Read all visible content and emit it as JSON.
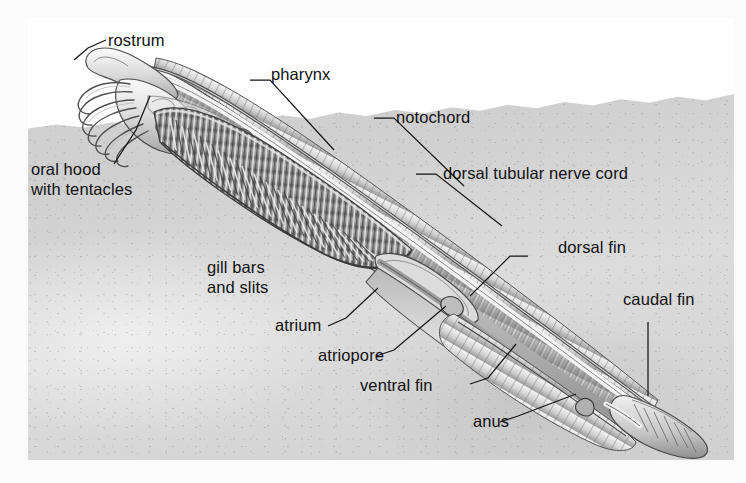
{
  "figure": {
    "view": "lateral cutaway, animal buried tail-down in sediment",
    "palette": {
      "background": "#fdfdfd",
      "water": "#ffffff",
      "sediment_light": "#dcdcdc",
      "sediment_mid": "#d0d0d0",
      "body_light": "#f2f2f2",
      "body_mid": "#b9b9b9",
      "body_dark": "#6e6e6e",
      "outline": "#4a4a4a",
      "label_text": "#111111",
      "leader_line": "#151515"
    }
  },
  "labels": [
    {
      "id": "rostrum",
      "text": "rostrum"
    },
    {
      "id": "pharynx",
      "text": "pharynx"
    },
    {
      "id": "notochord",
      "text": "notochord"
    },
    {
      "id": "dorsal-nerve-cord",
      "text": "dorsal tubular nerve cord"
    },
    {
      "id": "oral-hood-line1",
      "text": "oral hood"
    },
    {
      "id": "oral-hood-line2",
      "text": "with tentacles"
    },
    {
      "id": "dorsal-fin",
      "text": "dorsal fin"
    },
    {
      "id": "caudal-fin",
      "text": "caudal fin"
    },
    {
      "id": "gill-bars-line1",
      "text": "gill bars"
    },
    {
      "id": "gill-bars-line2",
      "text": "and slits"
    },
    {
      "id": "atrium",
      "text": "atrium"
    },
    {
      "id": "atriopore",
      "text": "atriopore"
    },
    {
      "id": "ventral-fin",
      "text": "ventral fin"
    },
    {
      "id": "anus",
      "text": "anus"
    }
  ]
}
